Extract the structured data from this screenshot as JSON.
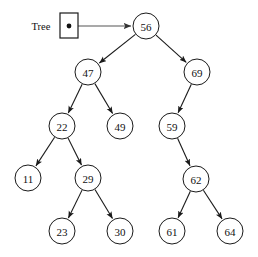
{
  "diagram": {
    "background_color": "#ffffff",
    "stroke_color": "#1a1a1a",
    "pointer_stroke_color": "#555555",
    "node_fill_color": "#ffffff",
    "node_radius": 13
  },
  "root_pointer": {
    "label": "Tree",
    "label_x": 41,
    "label_y": 26,
    "box": {
      "x": 60,
      "y": 13,
      "width": 18,
      "height": 25
    },
    "dot": {
      "cx": 69,
      "cy": 26,
      "r": 2.4
    },
    "arrow": {
      "x1": 69,
      "y1": 26,
      "x2": 131,
      "y2": 26
    }
  },
  "nodes": [
    {
      "id": "n56",
      "value": "56",
      "cx": 146,
      "cy": 26,
      "level": 0
    },
    {
      "id": "n47",
      "value": "47",
      "cx": 88,
      "cy": 72,
      "level": 1
    },
    {
      "id": "n69",
      "value": "69",
      "cx": 197,
      "cy": 72,
      "level": 1
    },
    {
      "id": "n22",
      "value": "22",
      "cx": 62,
      "cy": 126,
      "level": 2
    },
    {
      "id": "n49",
      "value": "49",
      "cx": 120,
      "cy": 126,
      "level": 2
    },
    {
      "id": "n59",
      "value": "59",
      "cx": 172,
      "cy": 126,
      "level": 2
    },
    {
      "id": "n11",
      "value": "11",
      "cx": 28,
      "cy": 178,
      "level": 3
    },
    {
      "id": "n29",
      "value": "29",
      "cx": 88,
      "cy": 178,
      "level": 3
    },
    {
      "id": "n62",
      "value": "62",
      "cx": 196,
      "cy": 179,
      "level": 3
    },
    {
      "id": "n23",
      "value": "23",
      "cx": 62,
      "cy": 231,
      "level": 4
    },
    {
      "id": "n30",
      "value": "30",
      "cx": 120,
      "cy": 231,
      "level": 4
    },
    {
      "id": "n61",
      "value": "61",
      "cx": 172,
      "cy": 231,
      "level": 4
    },
    {
      "id": "n64",
      "value": "64",
      "cx": 230,
      "cy": 231,
      "level": 4
    }
  ],
  "edges": [
    {
      "id": "e56-47",
      "from": "n56",
      "to": "n47",
      "side": "left"
    },
    {
      "id": "e56-69",
      "from": "n56",
      "to": "n69",
      "side": "right"
    },
    {
      "id": "e47-22",
      "from": "n47",
      "to": "n22",
      "side": "left"
    },
    {
      "id": "e47-49",
      "from": "n47",
      "to": "n49",
      "side": "right"
    },
    {
      "id": "e69-59",
      "from": "n69",
      "to": "n59",
      "side": "left"
    },
    {
      "id": "e22-11",
      "from": "n22",
      "to": "n11",
      "side": "left"
    },
    {
      "id": "e22-29",
      "from": "n22",
      "to": "n29",
      "side": "right"
    },
    {
      "id": "e59-62",
      "from": "n59",
      "to": "n62",
      "side": "right"
    },
    {
      "id": "e29-23",
      "from": "n29",
      "to": "n23",
      "side": "left"
    },
    {
      "id": "e29-30",
      "from": "n29",
      "to": "n30",
      "side": "right"
    },
    {
      "id": "e62-61",
      "from": "n62",
      "to": "n61",
      "side": "left"
    },
    {
      "id": "e62-64",
      "from": "n62",
      "to": "n64",
      "side": "right"
    }
  ],
  "traversal": {
    "inorder": [
      "11",
      "22",
      "23",
      "29",
      "30",
      "47",
      "49",
      "56",
      "59",
      "61",
      "62",
      "64",
      "69"
    ]
  }
}
